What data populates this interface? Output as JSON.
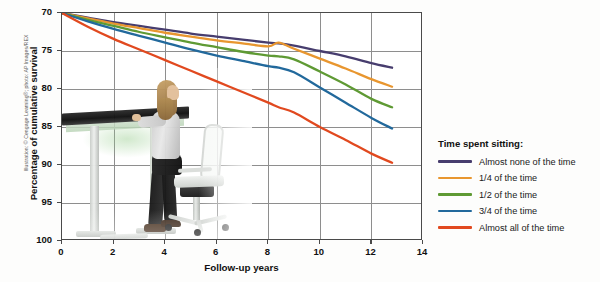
{
  "credit": "Illustration: © Cengage Learning®; photo: AP Images/REX",
  "axes": {
    "ytitle": "Percentage of cumulative survival",
    "xtitle": "Follow-up years",
    "xticks": [
      "0",
      "2",
      "4",
      "6",
      "8",
      "10",
      "12",
      "14"
    ],
    "yticks": [
      "100",
      "95",
      "90",
      "85",
      "80",
      "75",
      "70"
    ]
  },
  "legend": {
    "title": "Time spent sitting:",
    "items": [
      {
        "label": "Almost none of the time",
        "color": "#473d6e"
      },
      {
        "label": "1/4 of the time",
        "color": "#e8962f"
      },
      {
        "label": "1/2 of the time",
        "color": "#5f9a34"
      },
      {
        "label": "3/4 of the time",
        "color": "#22699c"
      },
      {
        "label": "Almost all of the time",
        "color": "#e1491f"
      }
    ]
  },
  "photo": {
    "alt": "Woman working while standing at an adjustable standing desk with an empty office chair beside her"
  },
  "chart_data": {
    "type": "line",
    "title": "",
    "xlabel": "Follow-up years",
    "ylabel": "Percentage of cumulative survival",
    "xlim": [
      0,
      14
    ],
    "ylim": [
      70,
      100
    ],
    "xticks": [
      0,
      2,
      4,
      6,
      8,
      10,
      12,
      14
    ],
    "yticks": [
      70,
      75,
      80,
      85,
      90,
      95,
      100
    ],
    "grid": true,
    "legend_position": "right",
    "legend_title": "Time spent sitting:",
    "series": [
      {
        "name": "Almost none of the time",
        "color": "#473d6e",
        "x": [
          0,
          1,
          2,
          3,
          4,
          5,
          6,
          7,
          8,
          8.4,
          9,
          10,
          11,
          12,
          12.8
        ],
        "y": [
          100,
          99.4,
          98.8,
          98.3,
          97.8,
          97.3,
          96.9,
          96.5,
          96.1,
          96.0,
          95.7,
          95.0,
          94.3,
          93.4,
          92.8
        ]
      },
      {
        "name": "1/4 of the time",
        "color": "#e8962f",
        "x": [
          0,
          1,
          2,
          3,
          4,
          5,
          6,
          7,
          8,
          8.4,
          9,
          10,
          11,
          12,
          12.8
        ],
        "y": [
          100,
          99.3,
          98.6,
          98.0,
          97.4,
          96.9,
          96.4,
          96.0,
          95.6,
          96.1,
          95.3,
          94.0,
          92.7,
          91.3,
          90.3
        ]
      },
      {
        "name": "1/2 of the time",
        "color": "#5f9a34",
        "x": [
          0,
          1,
          2,
          3,
          4,
          5,
          6,
          7,
          8,
          8.4,
          9,
          10,
          11,
          12,
          12.8
        ],
        "y": [
          100,
          99.1,
          98.3,
          97.5,
          96.8,
          96.1,
          95.5,
          94.9,
          94.4,
          94.3,
          93.9,
          92.3,
          90.6,
          88.7,
          87.6
        ]
      },
      {
        "name": "3/4 of the time",
        "color": "#22699c",
        "x": [
          0,
          1,
          2,
          3,
          4,
          5,
          6,
          7,
          8,
          8.4,
          9,
          10,
          11,
          12,
          12.8
        ],
        "y": [
          100,
          98.9,
          97.9,
          97.0,
          96.1,
          95.2,
          94.4,
          93.7,
          93.0,
          92.8,
          92.2,
          90.2,
          88.2,
          86.2,
          84.8
        ]
      },
      {
        "name": "Almost all of the time",
        "color": "#e1491f",
        "x": [
          0,
          1,
          2,
          3,
          4,
          5,
          6,
          7,
          8,
          8.4,
          9,
          10,
          11,
          12,
          12.8
        ],
        "y": [
          100,
          98.2,
          96.6,
          95.2,
          93.8,
          92.4,
          91.0,
          89.6,
          88.2,
          87.6,
          86.9,
          85.0,
          83.3,
          81.5,
          80.3
        ]
      }
    ]
  }
}
